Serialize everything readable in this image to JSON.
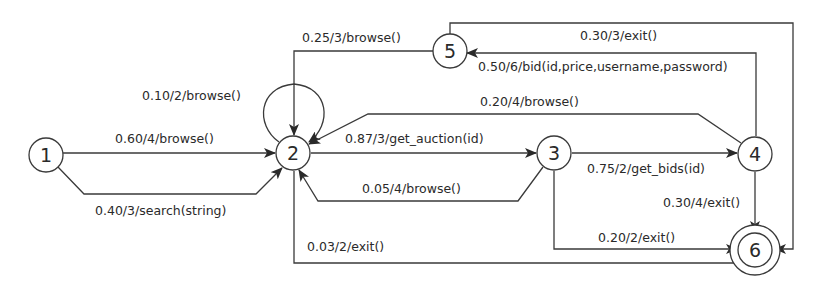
{
  "diagram": {
    "type": "state-transition-graph",
    "nodes": [
      {
        "id": "1",
        "label": "1",
        "x": 46,
        "y": 155,
        "final": false
      },
      {
        "id": "2",
        "label": "2",
        "x": 293,
        "y": 153,
        "final": false
      },
      {
        "id": "3",
        "label": "3",
        "x": 554,
        "y": 153,
        "final": false
      },
      {
        "id": "4",
        "label": "4",
        "x": 755,
        "y": 154,
        "final": false
      },
      {
        "id": "5",
        "label": "5",
        "x": 450,
        "y": 51,
        "final": false
      },
      {
        "id": "6",
        "label": "6",
        "x": 755,
        "y": 250,
        "final": true
      }
    ],
    "edges": [
      {
        "from": "1",
        "to": "2",
        "label": "0.60/4/browse()",
        "probability": 0.6,
        "weight": 4,
        "action": "browse()"
      },
      {
        "from": "1",
        "to": "2",
        "label": "0.40/3/search(string)",
        "probability": 0.4,
        "weight": 3,
        "action": "search(string)"
      },
      {
        "from": "2",
        "to": "2",
        "label": "0.10/2/browse()",
        "probability": 0.1,
        "weight": 2,
        "action": "browse()"
      },
      {
        "from": "2",
        "to": "3",
        "label": "0.87/3/get_auction(id)",
        "probability": 0.87,
        "weight": 3,
        "action": "get_auction(id)"
      },
      {
        "from": "2",
        "to": "6",
        "label": "0.03/2/exit()",
        "probability": 0.03,
        "weight": 2,
        "action": "exit()"
      },
      {
        "from": "3",
        "to": "2",
        "label": "0.05/4/browse()",
        "probability": 0.05,
        "weight": 4,
        "action": "browse()"
      },
      {
        "from": "3",
        "to": "4",
        "label": "0.75/2/get_bids(id)",
        "probability": 0.75,
        "weight": 2,
        "action": "get_bids(id)"
      },
      {
        "from": "3",
        "to": "6",
        "label": "0.20/2/exit()",
        "probability": 0.2,
        "weight": 2,
        "action": "exit()"
      },
      {
        "from": "4",
        "to": "2",
        "label": "0.20/4/browse()",
        "probability": 0.2,
        "weight": 4,
        "action": "browse()"
      },
      {
        "from": "4",
        "to": "5",
        "label": "0.50/6/bid(id,price,username,password)",
        "probability": 0.5,
        "weight": 6,
        "action": "bid(id,price,username,password)"
      },
      {
        "from": "4",
        "to": "6",
        "label": "0.30/4/exit()",
        "probability": 0.3,
        "weight": 4,
        "action": "exit()"
      },
      {
        "from": "5",
        "to": "2",
        "label": "0.25/3/browse()",
        "probability": 0.25,
        "weight": 3,
        "action": "browse()"
      },
      {
        "from": "5",
        "to": "6",
        "label": "0.30/3/exit()",
        "probability": 0.3,
        "weight": 3,
        "action": "exit()"
      }
    ]
  }
}
